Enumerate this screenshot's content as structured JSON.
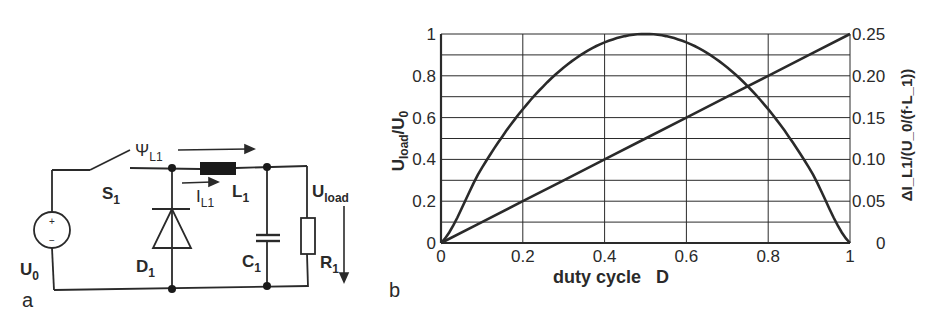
{
  "panel_a": {
    "label": "a",
    "components": {
      "source": "U",
      "source_sub": "0",
      "switch": "S",
      "switch_sub": "1",
      "diode": "D",
      "diode_sub": "1",
      "inductor": "L",
      "inductor_sub": "1",
      "capacitor": "C",
      "capacitor_sub": "1",
      "resistor": "R",
      "resistor_sub": "1",
      "flux": "Ψ",
      "flux_sub": "L1",
      "current": "I",
      "current_sub": "L1",
      "load_voltage": "U",
      "load_voltage_sub": "load",
      "plus": "+",
      "minus": "−"
    }
  },
  "panel_b": {
    "label": "b"
  },
  "chart_data": {
    "type": "line",
    "title": "",
    "xlabel": "duty cycle   D",
    "ylabel": "U_load/U_0",
    "ylabel_main": "U",
    "ylabel_sub": "load",
    "ylabel_tail": "/U",
    "ylabel_tail_sub": "0",
    "y2label": "ΔI_L1/(U_0/(f·L_1))",
    "xlim": [
      0,
      1
    ],
    "ylim": [
      0,
      1
    ],
    "y2lim": [
      0,
      0.25
    ],
    "grid": true,
    "x_ticks": [
      "0",
      "0.2",
      "0.4",
      "0.6",
      "0.8",
      "1"
    ],
    "y_ticks": [
      "0",
      "0.2",
      "0.4",
      "0.6",
      "0.8",
      "1"
    ],
    "y2_ticks": [
      "0",
      "0.05",
      "0.10",
      "0.15",
      "0.20",
      "0.25"
    ],
    "x": [
      0,
      0.1,
      0.2,
      0.3,
      0.4,
      0.5,
      0.6,
      0.7,
      0.8,
      0.9,
      1.0
    ],
    "series": [
      {
        "name": "U_load/U_0 (left axis)",
        "axis": "left",
        "values": [
          0,
          0.36,
          0.64,
          0.84,
          0.96,
          1.0,
          0.96,
          0.84,
          0.64,
          0.36,
          0
        ]
      },
      {
        "name": "ΔI_L1/(U_0/(f·L_1)) (right axis)",
        "axis": "right",
        "values": [
          0,
          0.025,
          0.05,
          0.075,
          0.1,
          0.125,
          0.15,
          0.175,
          0.2,
          0.225,
          0.25
        ]
      }
    ]
  }
}
